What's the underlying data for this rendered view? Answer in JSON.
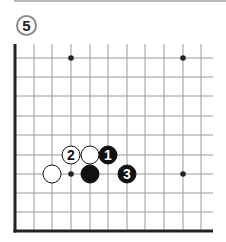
{
  "diagram": {
    "number_label": "5",
    "board": {
      "columns_x": [
        15,
        34,
        52,
        71,
        90,
        108,
        127,
        145,
        164,
        183,
        201
      ],
      "rows_y": [
        58,
        77,
        96,
        116,
        135,
        155,
        174,
        193,
        212,
        231
      ],
      "top_y": 44,
      "right_x": 213,
      "edges": [
        "left",
        "bottom"
      ],
      "star_points": [
        [
          71,
          58
        ],
        [
          183,
          58
        ],
        [
          71,
          174
        ],
        [
          183,
          174
        ]
      ]
    },
    "stones": [
      {
        "color": "black",
        "x": 108,
        "y": 155,
        "label": "1"
      },
      {
        "color": "white",
        "x": 71,
        "y": 155,
        "label": "2"
      },
      {
        "color": "black",
        "x": 127,
        "y": 174,
        "label": "3"
      },
      {
        "color": "white",
        "x": 90,
        "y": 155,
        "label": ""
      },
      {
        "color": "white",
        "x": 52,
        "y": 174,
        "label": ""
      },
      {
        "color": "black",
        "x": 90,
        "y": 174,
        "label": ""
      }
    ],
    "colors": {
      "grid": "#9a9a9a",
      "edge": "#222222",
      "black_stone": "#111111",
      "white_stone": "#ffffff",
      "badge_border": "#8a8a8a"
    }
  }
}
